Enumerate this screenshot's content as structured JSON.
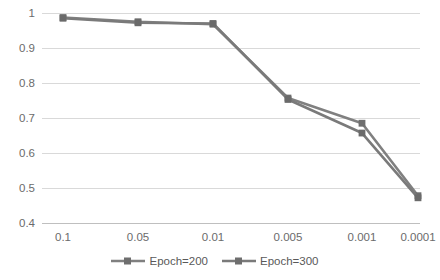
{
  "chart_data": {
    "type": "line",
    "title": "",
    "subtitle": "",
    "xlabel": "",
    "ylabel": "",
    "categories": [
      "0.1",
      "0.05",
      "0.01",
      "0.005",
      "0.001",
      "0.0001"
    ],
    "series": [
      {
        "name": "Epoch=200",
        "color": "#808080",
        "values": [
          0.987,
          0.975,
          0.968,
          0.757,
          0.685,
          0.478
        ]
      },
      {
        "name": "Epoch=300",
        "color": "#7a7a7a",
        "values": [
          0.985,
          0.972,
          0.97,
          0.753,
          0.657,
          0.472
        ]
      }
    ],
    "ylim": [
      0.4,
      1.0
    ],
    "yticks": [
      "0.4",
      "0.5",
      "0.6",
      "0.7",
      "0.8",
      "0.9",
      "1"
    ],
    "ytick_values": [
      0.4,
      0.5,
      0.6,
      0.7,
      0.8,
      0.9,
      1.0
    ],
    "grid": true,
    "grid_color": "#d9d9d9",
    "legend_position": "bottom",
    "marker": "square",
    "axis_text_color": "#6b6b6b",
    "background": "#ffffff"
  },
  "yaxis": {
    "t0": "1",
    "t1": "0.9",
    "t2": "0.8",
    "t3": "0.7",
    "t4": "0.6",
    "t5": "0.5",
    "t6": "0.4"
  },
  "xaxis": {
    "t0": "0.1",
    "t1": "0.05",
    "t2": "0.01",
    "t3": "0.005",
    "t4": "0.001",
    "t5": "0.0001"
  },
  "legend": {
    "entry0": "Epoch=200",
    "entry1": "Epoch=300"
  }
}
